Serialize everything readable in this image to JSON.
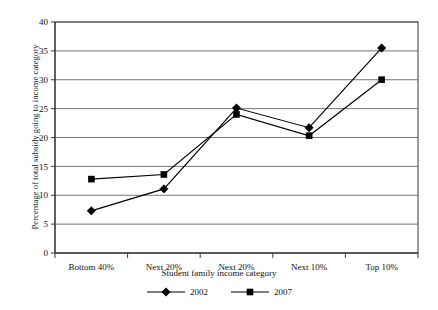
{
  "chart_data": {
    "type": "line",
    "title": "",
    "xlabel": "Student family income category",
    "ylabel": "Percentage of total subsidy going to income category",
    "categories": [
      "Bottom 40%",
      "Next 20%",
      "Next 20%",
      "Next 10%",
      "Top 10%"
    ],
    "series": [
      {
        "name": "2002",
        "marker": "diamond",
        "color": "#000000",
        "values": [
          7.3,
          11.1,
          25.1,
          21.7,
          35.5
        ]
      },
      {
        "name": "2007",
        "marker": "square",
        "color": "#000000",
        "values": [
          12.8,
          13.6,
          24.0,
          20.3,
          30.0
        ]
      }
    ],
    "ylim": [
      0,
      40
    ],
    "ytick_step": 5,
    "yticks": [
      "0",
      "5",
      "10",
      "15",
      "20",
      "25",
      "30",
      "35",
      "40"
    ],
    "grid": "horizontal",
    "legend_position": "bottom"
  }
}
